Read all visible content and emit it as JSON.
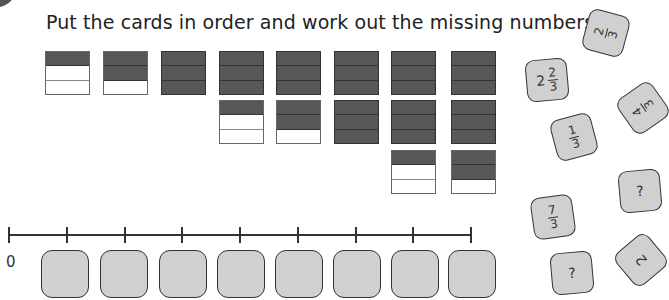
{
  "instruction": "Put the cards in order and work out the missing numbers.",
  "colors": {
    "filled": "#575757",
    "empty": "#ffffff",
    "card_fill": "#d0d0d0",
    "card_border": "#333333"
  },
  "bar_model": {
    "parts_per_whole": 3,
    "columns": [
      {
        "value": "1/3",
        "bars": [
          [
            1,
            0,
            0
          ]
        ]
      },
      {
        "value": "2/3",
        "bars": [
          [
            1,
            1,
            0
          ]
        ]
      },
      {
        "value": "1",
        "bars": [
          [
            1,
            1,
            1
          ]
        ]
      },
      {
        "value": "4/3",
        "bars": [
          [
            1,
            1,
            1
          ],
          [
            1,
            0,
            0
          ]
        ]
      },
      {
        "value": "5/3",
        "bars": [
          [
            1,
            1,
            1
          ],
          [
            1,
            1,
            0
          ]
        ]
      },
      {
        "value": "2",
        "bars": [
          [
            1,
            1,
            1
          ],
          [
            1,
            1,
            1
          ]
        ]
      },
      {
        "value": "7/3",
        "bars": [
          [
            1,
            1,
            1
          ],
          [
            1,
            1,
            1
          ],
          [
            1,
            0,
            0
          ]
        ]
      },
      {
        "value": "8/3",
        "bars": [
          [
            1,
            1,
            1
          ],
          [
            1,
            1,
            1
          ],
          [
            1,
            1,
            0
          ]
        ]
      }
    ]
  },
  "number_line": {
    "start_label": "0",
    "tick_count": 9,
    "empty_slots": 8
  },
  "cards": [
    {
      "id": "card-2-thirds",
      "type": "fraction",
      "num": "2",
      "den": "3",
      "rotation": -75
    },
    {
      "id": "card-2-and-2-thirds",
      "type": "mixed",
      "whole": "2",
      "num": "2",
      "den": "3",
      "rotation": -5
    },
    {
      "id": "card-4-thirds",
      "type": "fraction",
      "num": "4",
      "den": "3",
      "rotation": -125
    },
    {
      "id": "card-1-third",
      "type": "fraction",
      "num": "1",
      "den": "3",
      "rotation": -15
    },
    {
      "id": "card-missing-1",
      "type": "text",
      "text": "?",
      "rotation": -5
    },
    {
      "id": "card-7-thirds",
      "type": "fraction",
      "num": "7",
      "den": "3",
      "rotation": -8
    },
    {
      "id": "card-2",
      "type": "text",
      "text": "2",
      "rotation": -130
    },
    {
      "id": "card-missing-2",
      "type": "text",
      "text": "?",
      "rotation": -5
    }
  ]
}
